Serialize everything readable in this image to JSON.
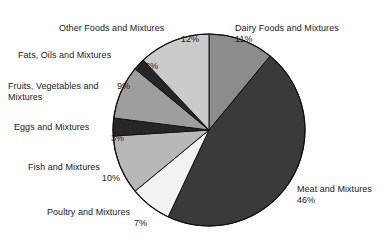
{
  "chart_data": {
    "type": "pie",
    "title": "",
    "subtitle": "",
    "xlabel": "",
    "ylabel": "",
    "legend_position": "none",
    "grid": false,
    "value_unit": "percent",
    "start_angle_deg": 0,
    "direction": "clockwise",
    "categories": [
      "Dairy Foods and Mixtures",
      "Meat and Mixtures",
      "Poultry and Mixtures",
      "Fish and Mixtures",
      "Eggs and Mixtures",
      "Fruits, Vegetables and Mixtures",
      "Fats, Oils and Mixtures",
      "Other Foods and Mixtures"
    ],
    "values": [
      11,
      46,
      7,
      10,
      3,
      9,
      2,
      12
    ],
    "colors": [
      "#8c8c8c",
      "#3a3a3a",
      "#f2f2f2",
      "#b8b8b8",
      "#262626",
      "#9e9e9e",
      "#262626",
      "#cbcbcb"
    ],
    "slices": [
      {
        "label": "Dairy Foods and Mixtures",
        "value": 11,
        "pct_text": "11%",
        "color": "#8c8c8c"
      },
      {
        "label": "Meat and Mixtures",
        "value": 46,
        "pct_text": "46%",
        "color": "#3a3a3a"
      },
      {
        "label": "Poultry and Mixtures",
        "value": 7,
        "pct_text": "7%",
        "color": "#f2f2f2"
      },
      {
        "label": "Fish and Mixtures",
        "value": 10,
        "pct_text": "10%",
        "color": "#b8b8b8"
      },
      {
        "label": "Eggs and Mixtures",
        "value": 3,
        "pct_text": "3%",
        "color": "#262626"
      },
      {
        "label": "Fruits, Vegetables and Mixtures",
        "value": 9,
        "pct_text": "9%",
        "color": "#9e9e9e"
      },
      {
        "label": "Fats, Oils and Mixtures",
        "value": 2,
        "pct_text": "2%",
        "color": "#262626"
      },
      {
        "label": "Other Foods and Mixtures",
        "value": 12,
        "pct_text": "12%",
        "color": "#cbcbcb"
      }
    ]
  },
  "labels": {
    "dairy": {
      "name": "Dairy Foods and Mixtures",
      "pct": "11%"
    },
    "meat": {
      "name": "Meat and Mixtures",
      "pct": "46%"
    },
    "poultry": {
      "name": "Poultry and Mixtures",
      "pct": "7%"
    },
    "fish": {
      "name": "Fish and Mixtures",
      "pct": "10%"
    },
    "eggs": {
      "name": "Eggs and Mixtures",
      "pct": "3%"
    },
    "fruits": {
      "name": "Fruits, Vegetables and",
      "name2": "Mixtures",
      "pct": "9%"
    },
    "fats": {
      "name": "Fats, Oils and Mixtures",
      "pct": "2%"
    },
    "other": {
      "name": "Other Foods and Mixtures",
      "pct": "12%"
    }
  },
  "geometry": {
    "center_x": 209,
    "center_y": 130,
    "radius": 96,
    "outline_color": "#111111"
  }
}
